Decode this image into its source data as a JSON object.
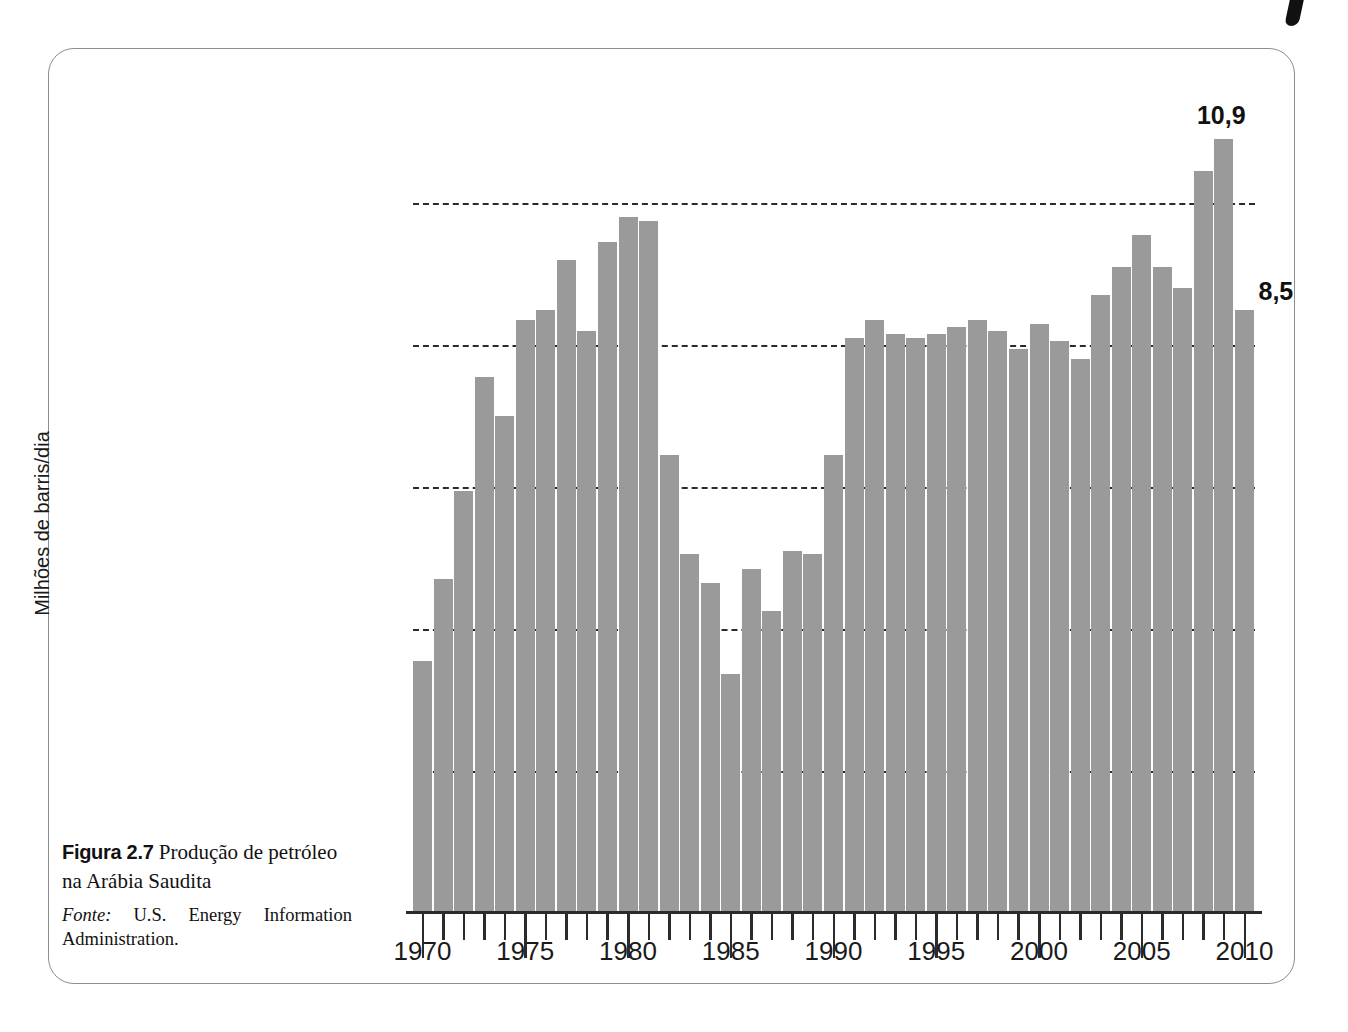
{
  "figure": {
    "label": "Figura 2.7",
    "title": "Produção de petróleo na Arábia Saudita",
    "source_label": "Fonte:",
    "source_text": "U.S. Energy Information Administration."
  },
  "chart_data": {
    "type": "bar",
    "title": "Produção de petróleo na Arábia Saudita",
    "xlabel": "",
    "ylabel": "Milhões de barris/dia",
    "grid": true,
    "legend": null,
    "ylim": [
      0,
      12
    ],
    "y_gridlines": [
      2,
      4,
      6,
      8,
      10
    ],
    "x_tick_labels": [
      "1970",
      "1975",
      "1980",
      "1985",
      "1990",
      "1995",
      "2000",
      "2005",
      "2010"
    ],
    "x_tick_label_years": [
      1970,
      1975,
      1980,
      1985,
      1990,
      1995,
      2000,
      2005,
      2010
    ],
    "bar_color": "#9a9a9a",
    "categories": [
      1970,
      1971,
      1972,
      1973,
      1974,
      1975,
      1976,
      1977,
      1978,
      1979,
      1980,
      1981,
      1982,
      1983,
      1984,
      1985,
      1986,
      1987,
      1988,
      1989,
      1990,
      1991,
      1992,
      1993,
      1994,
      1995,
      1996,
      1997,
      1998,
      1999,
      2000,
      2001,
      2002,
      2003,
      2004,
      2005,
      2006,
      2007,
      2008,
      2009,
      2010
    ],
    "values": [
      3.55,
      4.7,
      5.95,
      7.55,
      7.0,
      8.35,
      8.5,
      9.2,
      8.2,
      9.45,
      9.8,
      9.75,
      6.45,
      5.05,
      4.65,
      3.37,
      4.85,
      4.25,
      5.1,
      5.05,
      6.45,
      8.1,
      8.35,
      8.15,
      8.1,
      8.15,
      8.25,
      8.35,
      8.2,
      7.95,
      8.3,
      8.05,
      7.8,
      8.7,
      9.1,
      9.55,
      9.1,
      8.8,
      10.45,
      10.9,
      8.5
    ],
    "annotations": [
      {
        "year": 2009,
        "text": "10,9",
        "value": 10.9
      },
      {
        "year": 2010,
        "text": "8,5",
        "value": 8.5
      }
    ]
  }
}
